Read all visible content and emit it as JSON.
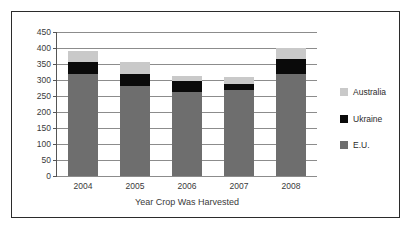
{
  "chart_data": {
    "type": "bar",
    "stacked": true,
    "title": "",
    "subtitle": "",
    "xlabel": "Year Crop Was Harvested",
    "ylabel": "",
    "categories": [
      "2004",
      "2005",
      "2006",
      "2007",
      "2008"
    ],
    "ylim": [
      0,
      450
    ],
    "ytick_values": [
      0,
      50,
      100,
      150,
      200,
      250,
      300,
      350,
      400,
      450
    ],
    "ytick_labels": [
      "0",
      "50",
      "100",
      "150",
      "200",
      "250",
      "300",
      "350",
      "400",
      "450"
    ],
    "grid": true,
    "legend_position": "right",
    "series": [
      {
        "name": "E.U.",
        "color": "#6e6e6e",
        "values": [
          318,
          280,
          263,
          268,
          318
        ]
      },
      {
        "name": "Ukraine",
        "color": "#0a0a0a",
        "values": [
          37,
          38,
          34,
          19,
          49
        ]
      },
      {
        "name": "Australia",
        "color": "#c9c9c9",
        "values": [
          35,
          37,
          16,
          23,
          33
        ]
      }
    ],
    "cumulative_tops": {
      "E.U.": [
        318,
        280,
        263,
        268,
        318
      ],
      "Ukraine": [
        355,
        318,
        297,
        287,
        367
      ],
      "Australia": [
        390,
        355,
        313,
        310,
        400
      ]
    },
    "totals": [
      390,
      355,
      313,
      310,
      400
    ]
  },
  "legend": {
    "entries": [
      {
        "label": "Australia",
        "color": "#c9c9c9"
      },
      {
        "label": "Ukraine",
        "color": "#0a0a0a"
      },
      {
        "label": "E.U.",
        "color": "#6e6e6e"
      }
    ]
  },
  "colors": {
    "frame_border": "#2b2b2b",
    "gridline": "#8c8c8c",
    "axis": "#555555",
    "text": "#3a3a3a",
    "background": "#ffffff"
  }
}
